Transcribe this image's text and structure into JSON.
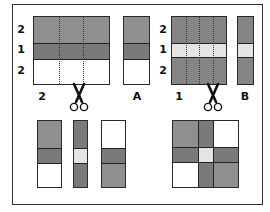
{
  "colors": {
    "medium_gray": "#8f8f8f",
    "dark_gray": "#7a7a7a",
    "light": "#e4e4e4",
    "white": "#ffffff",
    "line": "#2a2a2a"
  },
  "panel_a": {
    "row_labels": [
      "2",
      "1",
      "2"
    ],
    "bottom_label": "2",
    "strip_label": "A",
    "bands": [
      "medium",
      "dark",
      "white"
    ]
  },
  "panel_b": {
    "row_labels": [
      "2",
      "1",
      "2"
    ],
    "bottom_label": "1",
    "strip_label": "B",
    "bands": [
      "medium",
      "light",
      "medium"
    ]
  },
  "bottom_left": {
    "strips": [
      {
        "bands": [
          "medium",
          "dark",
          "white"
        ]
      },
      {
        "bands": [
          "dark",
          "light",
          "dark"
        ]
      },
      {
        "bands": [
          "white",
          "dark",
          "medium"
        ]
      }
    ]
  },
  "bottom_right": {
    "grid": [
      [
        "medium",
        "dark",
        "white"
      ],
      [
        "dark",
        "light",
        "dark"
      ],
      [
        "white",
        "dark",
        "medium"
      ]
    ]
  },
  "icons": {
    "scissors_left": "scissors-icon",
    "scissors_right": "scissors-icon"
  }
}
